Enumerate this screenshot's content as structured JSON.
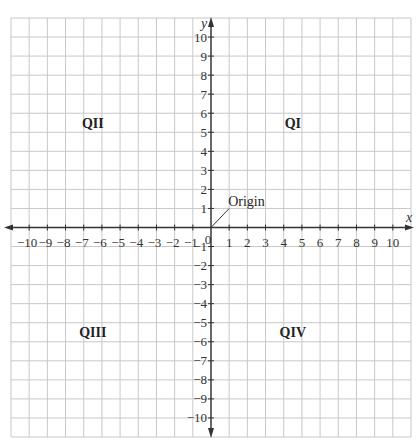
{
  "chart_data": {
    "type": "diagram",
    "title": "",
    "xlabel": "x",
    "ylabel": "y",
    "xlim": [
      -11,
      11
    ],
    "ylim": [
      -11,
      11
    ],
    "grid": true,
    "x_ticks": [
      -10,
      -9,
      -8,
      -7,
      -6,
      -5,
      -4,
      -3,
      -2,
      -1,
      1,
      2,
      3,
      4,
      5,
      6,
      7,
      8,
      9,
      10
    ],
    "y_ticks": [
      10,
      9,
      8,
      7,
      6,
      5,
      4,
      3,
      2,
      1,
      -1,
      -2,
      -3,
      -4,
      -5,
      -6,
      -7,
      -8,
      -9,
      -10
    ],
    "origin_tick_label": "0",
    "quadrants": [
      {
        "label": "QI",
        "x": 4.5,
        "y": 5.5
      },
      {
        "label": "QII",
        "x": -6.5,
        "y": 5.5
      },
      {
        "label": "QIII",
        "x": -6.5,
        "y": -5.5
      },
      {
        "label": "QIV",
        "x": 4.5,
        "y": -5.5
      }
    ],
    "annotations": [
      {
        "text": "Origin",
        "points_to": [
          0,
          0
        ],
        "label_at": [
          1,
          1
        ]
      }
    ]
  },
  "colors": {
    "grid": "#c8c8c8",
    "axis": "#333333",
    "text": "#222222"
  }
}
